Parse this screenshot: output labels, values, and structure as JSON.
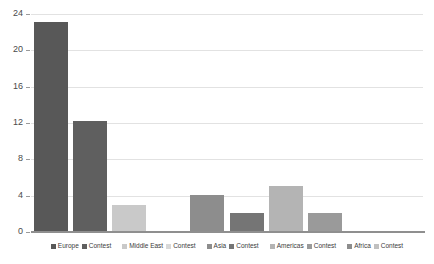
{
  "chart_data": {
    "type": "bar",
    "title": "",
    "subtitle": "",
    "xlabel": "",
    "ylabel": "",
    "ylim": [
      0,
      24
    ],
    "yticks": [
      0,
      4,
      8,
      12,
      16,
      20,
      24
    ],
    "ytick_labels": [
      "0",
      "4",
      "8",
      "12",
      "16",
      "20",
      "24"
    ],
    "grid": true,
    "legend_position": "bottom",
    "categories": [
      "Europe",
      "Contest",
      "Middle East",
      "Contest",
      "Asia",
      "Contest",
      "Americas",
      "Contest",
      "Africa",
      "Contest"
    ],
    "values": [
      23.1,
      12.2,
      3.0,
      0,
      4.1,
      2.1,
      5.1,
      2.1,
      0.1,
      0
    ],
    "bar_colors": [
      "#585858",
      "#5f5f5f",
      "#c9c9c9",
      "#ffffff",
      "#8d8d8d",
      "#757575",
      "#b4b4b4",
      "#9a9a9a",
      "#8d8d8d",
      "#ffffff"
    ]
  },
  "legend": {
    "items": [
      {
        "label": "Europe",
        "color": "#585858"
      },
      {
        "label": "Contest",
        "color": "#5f5f5f"
      },
      {
        "label": "Middle East",
        "color": "#c9c9c9"
      },
      {
        "label": "Contest",
        "color": "#d8d8d8"
      },
      {
        "label": "Asia",
        "color": "#8d8d8d"
      },
      {
        "label": "Contest",
        "color": "#757575"
      },
      {
        "label": "Americas",
        "color": "#b4b4b4"
      },
      {
        "label": "Contest",
        "color": "#9a9a9a"
      },
      {
        "label": "Africa",
        "color": "#8d8d8d"
      },
      {
        "label": "Contest",
        "color": "#c0c0c0"
      }
    ]
  },
  "style": {
    "gridline_color": "#e2e2e2",
    "axis_color": "#8f8f8f",
    "background": "#ffffff",
    "tick_text_color": "#4a4a4a"
  }
}
